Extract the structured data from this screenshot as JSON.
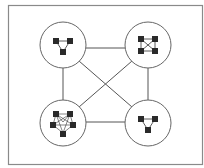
{
  "diagram": {
    "type": "network-of-networks",
    "colors": {
      "frame": "#888888",
      "edge": "#555555",
      "circle_stroke": "#666666",
      "circle_fill": "#ffffff",
      "node": "#2a2a2a",
      "inner_edge": "#333333"
    },
    "clusters": [
      {
        "id": "top-left",
        "cx": 63,
        "cy": 45,
        "r": 23,
        "topology": "triangle"
      },
      {
        "id": "top-right",
        "cx": 148,
        "cy": 45,
        "r": 23,
        "topology": "complete-4"
      },
      {
        "id": "bottom-left",
        "cx": 63,
        "cy": 123,
        "r": 23,
        "topology": "dense-5"
      },
      {
        "id": "bottom-right",
        "cx": 148,
        "cy": 123,
        "r": 23,
        "topology": "triangle"
      }
    ],
    "links": [
      [
        "top-left",
        "top-right"
      ],
      [
        "top-left",
        "bottom-left"
      ],
      [
        "top-left",
        "bottom-right"
      ],
      [
        "top-right",
        "bottom-left"
      ],
      [
        "top-right",
        "bottom-right"
      ],
      [
        "bottom-left",
        "bottom-right"
      ]
    ]
  }
}
